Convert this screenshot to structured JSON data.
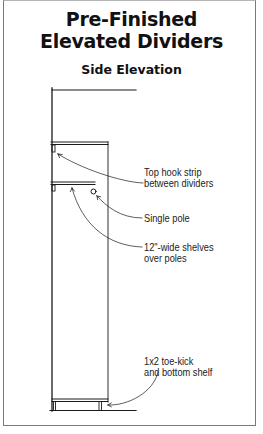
{
  "title": {
    "line1": "Pre-Finished",
    "line2": "Elevated Dividers"
  },
  "subtitle": "Side Elevation",
  "callouts": [
    {
      "id": "top-hook-strip",
      "line1": "Top hook strip",
      "line2": "between dividers"
    },
    {
      "id": "single-pole",
      "line1": "Single pole"
    },
    {
      "id": "shelves",
      "line1": "12\"-wide shelves",
      "line2": "over poles"
    },
    {
      "id": "toe-kick",
      "line1": "1x2 toe-kick",
      "line2": "and bottom shelf"
    }
  ]
}
